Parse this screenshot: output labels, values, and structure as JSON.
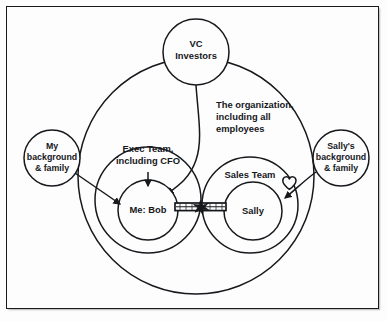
{
  "diagram": {
    "background_color": "#fdfdfd",
    "ink_color": "#16181c",
    "frame": {
      "style": "thin black rectangle with drop shadow"
    },
    "nodes": {
      "vc_investors": {
        "label_line1": "VC",
        "label_line2": "Investors",
        "shape": "circle",
        "position": "top-center, straddling the organization boundary"
      },
      "organization": {
        "caption_line1": "The organization,",
        "caption_line2": "including all",
        "caption_line3": "employees",
        "shape": "large circle",
        "position": "center"
      },
      "exec_team": {
        "label_line1": "Exec Team,",
        "label_line2": "including CFO",
        "shape": "circle",
        "position": "center-left inside organization"
      },
      "sales_team": {
        "label": "Sales Team",
        "shape": "circle",
        "position": "center-right inside organization"
      },
      "bob": {
        "label": "Me: Bob",
        "shape": "circle",
        "position": "inside exec team"
      },
      "sally": {
        "label": "Sally",
        "shape": "circle",
        "position": "inside sales team"
      },
      "my_background": {
        "label_line1": "My",
        "label_line2": "background",
        "label_line3": "& family",
        "shape": "circle",
        "position": "far left, outside organization"
      },
      "sallys_background": {
        "label_line1": "Sally's",
        "label_line2": "background",
        "label_line3": "& family",
        "shape": "circle",
        "position": "far right, outside organization"
      }
    },
    "connectors": [
      {
        "name": "vc-to-bob",
        "from": "vc_investors",
        "to": "bob",
        "style": "curved line with arrowhead"
      },
      {
        "name": "exec-team-to-bob",
        "from": "exec_team",
        "to": "bob",
        "style": "short straight line with arrowhead pointing down"
      },
      {
        "name": "my-background-to-bob",
        "from": "my_background",
        "to": "bob",
        "style": "straight line with arrowhead"
      },
      {
        "name": "sallys-background-to-sally",
        "from": "sallys_background",
        "to": "sally",
        "style": "line with arrowhead, heart symbol near start"
      },
      {
        "name": "bob-sally-bond",
        "from": "bob",
        "to": "sally",
        "style": "thick double band with star knot at midpoint"
      }
    ],
    "symbols": {
      "heart": "heart-shape near Sally's background connector",
      "knot": "star/X knot at midpoint of the Bob-Sally band"
    }
  }
}
